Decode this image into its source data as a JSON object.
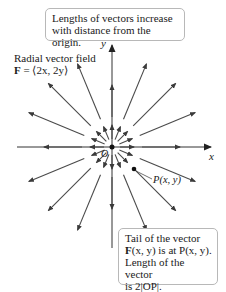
{
  "top_callout": {
    "line1": "Lengths of vectors increase",
    "line2": "with distance from the origin."
  },
  "field_label": {
    "line1": "Radial vector field",
    "line2_bold": "F",
    "line2_rest": " = ⟨2x, 2y⟩"
  },
  "axes": {
    "x_label": "x",
    "y_label": "y",
    "origin_label": "O"
  },
  "point_label": "P(x, y)",
  "bottom_callout": {
    "line1": "Tail of the vector",
    "line2_bold": "F",
    "line2_rest": "(x, y) is at P(x, y).",
    "line3": "Length of the vector",
    "line4": "is 2|OP|."
  },
  "colors": {
    "arrow": "#4a4a4a",
    "axis": "#333333",
    "callout_border": "#b8b8b8"
  },
  "vector_field": {
    "origin_px": [
      112,
      147
    ],
    "directions": 16,
    "inner_arrow": {
      "tail_r": 8,
      "head_r": 22
    },
    "outer_arrow": {
      "tail_r": 30,
      "head_r": 90
    }
  }
}
